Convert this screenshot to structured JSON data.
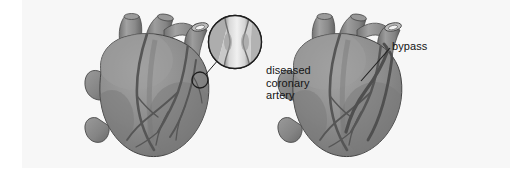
{
  "figure": {
    "domain": "medical-illustration",
    "panel_count": 2,
    "background_color": "#ffffff",
    "panel_color": "#f7f7f7",
    "heart_fill_color": "#8e8e8e",
    "heart_shadow_color": "#6f6f6f",
    "heart_highlight_color": "#a8a8a8",
    "vessel_color": "#555555",
    "outline_color": "#3d3d3d",
    "text_color": "#141414"
  },
  "labels": {
    "diseased_artery": {
      "line1": "diseased",
      "line2": "coronary",
      "line3": "artery"
    },
    "bypass": {
      "text": "bypass"
    }
  },
  "left_panel": {
    "name": "diseased-heart",
    "description": "heart with diseased coronary artery",
    "callout": {
      "marker_shape": "circle",
      "marker_center_x": 200,
      "marker_center_y": 80,
      "marker_radius": 8,
      "inset_center_x": 235,
      "inset_center_y": 42,
      "inset_radius": 27,
      "inset_content": "narrowed stenotic vessel segment"
    }
  },
  "right_panel": {
    "name": "bypass-heart",
    "description": "heart with bypass grafts attached",
    "graft_count": 2,
    "leader_line": {
      "from_x": 390,
      "from_y": 48,
      "to_x": 361,
      "to_y": 81
    }
  }
}
